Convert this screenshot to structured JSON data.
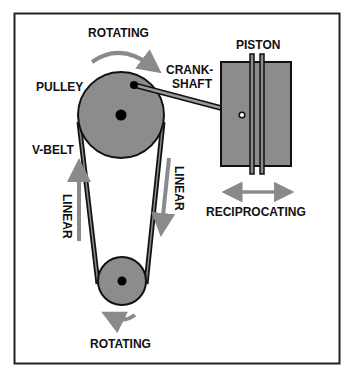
{
  "diagram": {
    "labels": {
      "rotating_top": "ROTATING",
      "piston": "PISTON",
      "crank_line1": "CRANK-",
      "crank_line2": "SHAFT",
      "pulley": "PULLEY",
      "vbelt": "V-BELT",
      "linear_left": "LINEAR",
      "linear_right": "LINEAR",
      "reciprocating": "RECIPROCATING",
      "rotating_bottom": "ROTATING"
    },
    "colors": {
      "part_fill": "#8c8c8c",
      "arrow": "#8a8a8a",
      "outline": "#111111",
      "background": "#ffffff"
    }
  }
}
